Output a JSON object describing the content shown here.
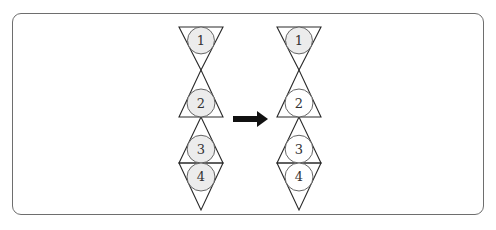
{
  "diagram": {
    "left_figure": {
      "circles": [
        {
          "label": "1",
          "shaded": true
        },
        {
          "label": "2",
          "shaded": true
        },
        {
          "label": "3",
          "shaded": true
        },
        {
          "label": "4",
          "shaded": true
        }
      ]
    },
    "arrow": {
      "direction": "right"
    },
    "right_figure": {
      "circles": [
        {
          "label": "1",
          "shaded": true
        },
        {
          "label": "2",
          "shaded": false
        },
        {
          "label": "3",
          "shaded": false
        },
        {
          "label": "4",
          "shaded": false
        }
      ]
    },
    "colors": {
      "line": "#2a2a2a",
      "shade": "#ececec",
      "frame": "#6e6e6e",
      "arrow": "#111111"
    }
  }
}
